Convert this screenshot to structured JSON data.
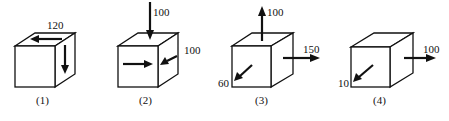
{
  "figure": {
    "type": "stress-state cubes",
    "cubes": [
      {
        "caption": "(1)",
        "forces": [
          {
            "label": "120",
            "face": "top",
            "direction": "left"
          },
          {
            "label": "",
            "face": "right",
            "direction": "down"
          }
        ]
      },
      {
        "caption": "(2)",
        "forces": [
          {
            "label": "100",
            "face": "top",
            "direction": "down"
          },
          {
            "label": "100",
            "face": "right",
            "direction": "into face (diagonal)"
          },
          {
            "label": "",
            "face": "front",
            "direction": "right"
          }
        ]
      },
      {
        "caption": "(3)",
        "forces": [
          {
            "label": "100",
            "face": "top",
            "direction": "up"
          },
          {
            "label": "150",
            "face": "right",
            "direction": "right"
          },
          {
            "label": "60",
            "face": "front",
            "direction": "out of face (diagonal)"
          }
        ]
      },
      {
        "caption": "(4)",
        "forces": [
          {
            "label": "100",
            "face": "right",
            "direction": "right"
          },
          {
            "label": "10",
            "face": "front",
            "direction": "out of face (diagonal)"
          }
        ]
      }
    ]
  }
}
